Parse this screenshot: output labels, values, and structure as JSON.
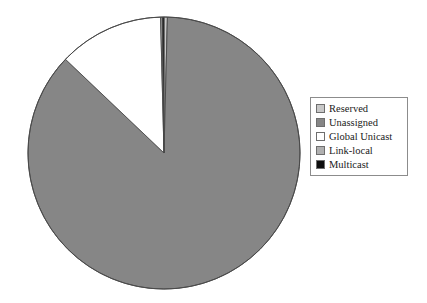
{
  "chart_data": {
    "type": "pie",
    "title": "",
    "subtitle": "",
    "xlabel": "",
    "ylabel": "",
    "legend_position": "right",
    "grid": false,
    "start_angle_deg": 90,
    "direction": "clockwise",
    "categories": [
      "Reserved",
      "Unassigned",
      "Global Unicast",
      "Link-local",
      "Multicast"
    ],
    "values": [
      0.4,
      86.7,
      12.5,
      0.2,
      0.2
    ],
    "value_unit": "percent",
    "colors": [
      "#c8c8c8",
      "#868686",
      "#ffffff",
      "#b0b0b0",
      "#0d0d0d"
    ],
    "slices": [
      {
        "label": "Reserved",
        "value": 0.4,
        "color": "#c8c8c8"
      },
      {
        "label": "Unassigned",
        "value": 86.7,
        "color": "#868686"
      },
      {
        "label": "Global Unicast",
        "value": 12.5,
        "color": "#ffffff"
      },
      {
        "label": "Link-local",
        "value": 0.2,
        "color": "#b0b0b0"
      },
      {
        "label": "Multicast",
        "value": 0.2,
        "color": "#0d0d0d"
      }
    ]
  },
  "legend": {
    "items": [
      {
        "label": "Reserved",
        "color": "#c8c8c8"
      },
      {
        "label": "Unassigned",
        "color": "#868686"
      },
      {
        "label": "Global Unicast",
        "color": "#ffffff"
      },
      {
        "label": "Link-local",
        "color": "#b0b0b0"
      },
      {
        "label": "Multicast",
        "color": "#0d0d0d"
      }
    ]
  },
  "geometry": {
    "center_x": 164,
    "center_y": 153,
    "radius": 136,
    "outline_color": "#4a4a4a"
  }
}
